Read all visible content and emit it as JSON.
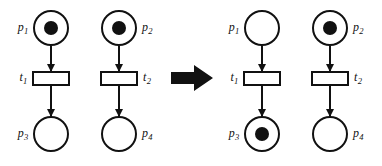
{
  "figure": {
    "type": "petri-net-firing",
    "background_color": "#ffffff",
    "stroke_color": "#111111"
  },
  "diagrams": [
    {
      "id": "before",
      "name": "petri-net-before",
      "places": [
        {
          "id": "p1",
          "label": "p",
          "sub": "1",
          "tokens": 1,
          "label_side": "left",
          "cx": 51,
          "cy": 28,
          "r": 18
        },
        {
          "id": "p2",
          "label": "p",
          "sub": "2",
          "tokens": 1,
          "label_side": "right",
          "cx": 119,
          "cy": 28,
          "r": 18
        },
        {
          "id": "p3",
          "label": "p",
          "sub": "3",
          "tokens": 0,
          "label_side": "left",
          "cx": 51,
          "cy": 134,
          "r": 18
        },
        {
          "id": "p4",
          "label": "p",
          "sub": "4",
          "tokens": 0,
          "label_side": "right",
          "cx": 119,
          "cy": 134,
          "r": 18
        }
      ],
      "transitions": [
        {
          "id": "t1",
          "label": "t",
          "sub": "1",
          "label_side": "left",
          "cx": 51,
          "cy": 78,
          "w": 38,
          "h": 15
        },
        {
          "id": "t2",
          "label": "t",
          "sub": "2",
          "label_side": "right",
          "cx": 119,
          "cy": 78,
          "w": 38,
          "h": 15
        }
      ],
      "arcs": [
        {
          "from": "p1",
          "to": "t1"
        },
        {
          "from": "t1",
          "to": "p3"
        },
        {
          "from": "p2",
          "to": "t2"
        },
        {
          "from": "t2",
          "to": "p4"
        }
      ]
    },
    {
      "id": "after",
      "name": "petri-net-after",
      "places": [
        {
          "id": "p1",
          "label": "p",
          "sub": "1",
          "tokens": 0,
          "label_side": "left",
          "cx": 262,
          "cy": 28,
          "r": 18
        },
        {
          "id": "p2",
          "label": "p",
          "sub": "2",
          "tokens": 1,
          "label_side": "right",
          "cx": 330,
          "cy": 28,
          "r": 18
        },
        {
          "id": "p3",
          "label": "p",
          "sub": "3",
          "tokens": 1,
          "label_side": "left",
          "cx": 262,
          "cy": 134,
          "r": 18
        },
        {
          "id": "p4",
          "label": "p",
          "sub": "4",
          "tokens": 0,
          "label_side": "right",
          "cx": 330,
          "cy": 134,
          "r": 18
        }
      ],
      "transitions": [
        {
          "id": "t1",
          "label": "t",
          "sub": "1",
          "label_side": "left",
          "cx": 262,
          "cy": 78,
          "w": 38,
          "h": 15
        },
        {
          "id": "t2",
          "label": "t",
          "sub": "2",
          "label_side": "right",
          "cx": 330,
          "cy": 78,
          "w": 38,
          "h": 15
        }
      ],
      "arcs": [
        {
          "from": "p1",
          "to": "t1"
        },
        {
          "from": "t1",
          "to": "p3"
        },
        {
          "from": "p2",
          "to": "t2"
        },
        {
          "from": "t2",
          "to": "p4"
        }
      ]
    }
  ],
  "transition_arrow": {
    "name": "firing-arrow",
    "direction": "right",
    "color": "#111111",
    "x": 171,
    "y": 65,
    "width": 42,
    "height": 26
  },
  "labels": {
    "p1": "p1",
    "p2": "p2",
    "p3": "p3",
    "p4": "p4",
    "t1": "t1",
    "t2": "t2"
  }
}
